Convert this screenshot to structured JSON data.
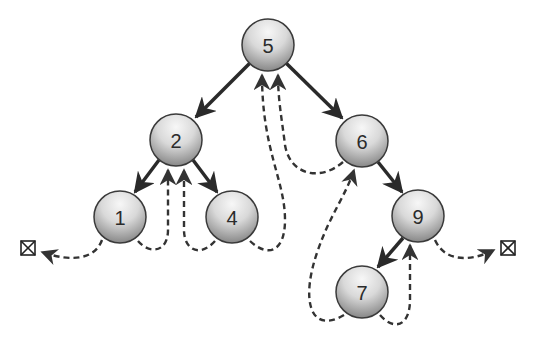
{
  "diagram": {
    "type": "binary-search-tree-threaded-traversal",
    "colors": {
      "edge": "#2a2a2a",
      "thread": "#333333",
      "node_stroke": "#3a3a3a",
      "node_fill_light": "#f2f2f2",
      "node_fill_dark": "#8a8a8a"
    },
    "nodes": [
      {
        "id": "n5",
        "label": "5",
        "x": 268,
        "y": 45
      },
      {
        "id": "n2",
        "label": "2",
        "x": 176,
        "y": 140
      },
      {
        "id": "n6",
        "label": "6",
        "x": 362,
        "y": 141
      },
      {
        "id": "n1",
        "label": "1",
        "x": 120,
        "y": 217
      },
      {
        "id": "n4",
        "label": "4",
        "x": 232,
        "y": 217
      },
      {
        "id": "n9",
        "label": "9",
        "x": 418,
        "y": 216
      },
      {
        "id": "n7",
        "label": "7",
        "x": 362,
        "y": 292
      }
    ],
    "edges": [
      {
        "from": "5",
        "to": "2"
      },
      {
        "from": "5",
        "to": "6"
      },
      {
        "from": "2",
        "to": "1"
      },
      {
        "from": "2",
        "to": "4"
      },
      {
        "from": "6",
        "to": "9"
      },
      {
        "from": "9",
        "to": "7"
      }
    ],
    "threads": [
      {
        "from": "1",
        "to": "nil-left"
      },
      {
        "from": "1",
        "to": "2"
      },
      {
        "from": "4",
        "to": "2"
      },
      {
        "from": "4",
        "to": "5"
      },
      {
        "from": "6",
        "to": "5"
      },
      {
        "from": "7",
        "to": "6"
      },
      {
        "from": "7",
        "to": "9"
      },
      {
        "from": "9",
        "to": "nil-right"
      }
    ],
    "nil_markers": [
      {
        "id": "nil-left",
        "symbol": "⊠",
        "x": 28,
        "y": 248
      },
      {
        "id": "nil-right",
        "symbol": "⊠",
        "x": 508,
        "y": 248
      }
    ]
  }
}
